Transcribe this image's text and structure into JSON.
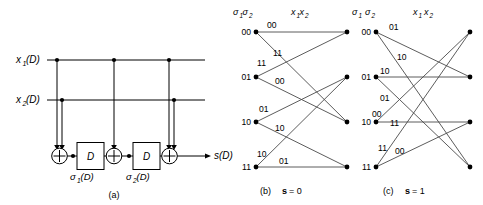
{
  "figure": {
    "panels": [
      {
        "id": "a",
        "caption": "(a)",
        "type": "encoder-circuit",
        "inputs": [
          {
            "name": "x1",
            "label_base": "x",
            "label_sub": "1",
            "label_tail": "(D)"
          },
          {
            "name": "x2",
            "label_base": "x",
            "label_sub": "2",
            "label_tail": "(D)"
          }
        ],
        "output": {
          "label_base": "s",
          "label_tail": "(D)"
        },
        "delay_label": "D",
        "state_labels": [
          {
            "base": "σ",
            "sub": "1",
            "tail": "(D)"
          },
          {
            "base": "σ",
            "sub": "2",
            "tail": "(D)"
          }
        ]
      },
      {
        "id": "b",
        "caption_prefix": "(b)",
        "caption_symbol": "s",
        "caption_eq": "= 0",
        "header_state": {
          "base": "σ",
          "sub1": "1",
          "base2": "σ",
          "sub2": "2",
          "spaced": false
        },
        "header_input": {
          "base": "x",
          "sub1": "1",
          "base2": "x",
          "sub2": "2",
          "spaced": false
        },
        "states": [
          "00",
          "01",
          "10",
          "11"
        ],
        "branches": [
          {
            "from": 0,
            "to": 0,
            "label": "00"
          },
          {
            "from": 0,
            "to": 2,
            "label": "11"
          },
          {
            "from": 1,
            "to": 0,
            "label": "11"
          },
          {
            "from": 1,
            "to": 2,
            "label": "00"
          },
          {
            "from": 2,
            "to": 1,
            "label": "01"
          },
          {
            "from": 2,
            "to": 3,
            "label": "10"
          },
          {
            "from": 3,
            "to": 1,
            "label": "10"
          },
          {
            "from": 3,
            "to": 3,
            "label": "01"
          }
        ]
      },
      {
        "id": "c",
        "caption_prefix": "(c)",
        "caption_symbol": "s",
        "caption_eq": "= 1",
        "header_state": {
          "base": "σ",
          "sub1": "1",
          "base2": "σ",
          "sub2": "2",
          "spaced": true
        },
        "header_input": {
          "base": "x",
          "sub1": "1",
          "base2": "x",
          "sub2": "2",
          "spaced": true
        },
        "states": [
          "00",
          "01",
          "10",
          "11"
        ],
        "branches": [
          {
            "from": 0,
            "to": 1,
            "label": "01"
          },
          {
            "from": 0,
            "to": 3,
            "label": "10"
          },
          {
            "from": 1,
            "to": 1,
            "label": "10"
          },
          {
            "from": 1,
            "to": 3,
            "label": "01"
          },
          {
            "from": 2,
            "to": 0,
            "label": "00"
          },
          {
            "from": 2,
            "to": 2,
            "label": "11"
          },
          {
            "from": 3,
            "to": 0,
            "label": "11"
          },
          {
            "from": 3,
            "to": 2,
            "label": "00"
          }
        ]
      }
    ]
  }
}
